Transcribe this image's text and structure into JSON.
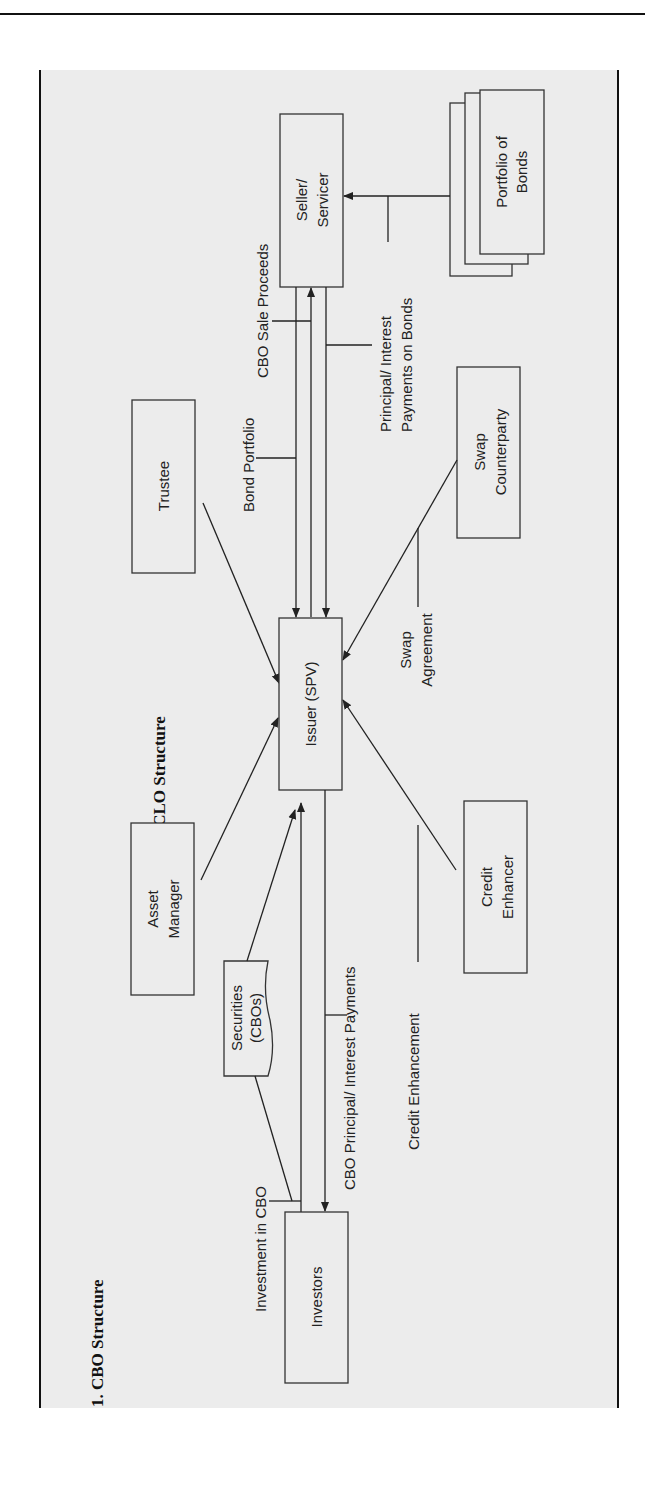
{
  "page": {
    "section_heading": "1. CBO Structure",
    "exhibit_title": "Exhibit 4.1   CBO/CLO Structure",
    "colors": {
      "panel": "#ececec",
      "line": "#222222",
      "rule": "#111111"
    }
  },
  "diagram": {
    "orientation": "rotated 90deg counter-clockwise",
    "nodes": {
      "seller": [
        "Seller/",
        "Servicer"
      ],
      "portfolio": [
        "Portfolio of",
        "Bonds"
      ],
      "trustee": [
        "Trustee"
      ],
      "issuer": [
        "Issuer (SPV)"
      ],
      "swap": [
        "Swap",
        "Counterparty"
      ],
      "asset_manager": [
        "Asset",
        "Manager"
      ],
      "credit_enhancer": [
        "Credit",
        "Enhancer"
      ],
      "securities": [
        "Securities",
        "(CBOs)"
      ],
      "investors": [
        "Investors"
      ]
    },
    "edge_labels": {
      "cbo_sale_proceeds": "CBO Sale Proceeds",
      "bond_portfolio": "Bond Portfolio",
      "pi_payments_bonds": [
        "Principal/ Interest",
        "Payments on Bonds"
      ],
      "swap_agreement": [
        "Swap",
        "Agreement"
      ],
      "investment_in_cbo": "Investment in CBO",
      "cbo_pi_payments": "CBO Principal/ Interest Payments",
      "credit_enhancement": "Credit Enhancement"
    }
  }
}
